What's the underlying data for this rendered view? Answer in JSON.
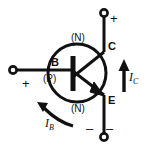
{
  "diagram": {
    "device_type": "NPN",
    "colors": {
      "background": "#ffffff",
      "stroke": "#111111",
      "text": "#111111"
    },
    "terminals": [
      {
        "id": "base",
        "label": "B",
        "side": "left",
        "node_marker": "open-circle"
      },
      {
        "id": "collector",
        "label": "C",
        "side": "top",
        "node_marker": "open-circle"
      },
      {
        "id": "emitter",
        "label": "E",
        "side": "bottom",
        "node_marker": "open-circle"
      }
    ],
    "region_labels": [
      {
        "id": "collector-region",
        "text": "(N)"
      },
      {
        "id": "base-region",
        "text": "(P)"
      },
      {
        "id": "emitter-region",
        "text": "(N)"
      }
    ],
    "polarity_signs": [
      {
        "id": "collector-positive",
        "text": "+"
      },
      {
        "id": "base-positive",
        "text": "+"
      },
      {
        "id": "emitter-negative-left",
        "text": "–"
      },
      {
        "id": "emitter-negative-right",
        "text": "–"
      }
    ],
    "currents": [
      {
        "id": "collector-current",
        "symbol": "I",
        "subscript": "C",
        "arrow": "up",
        "arrow_name": "collector-current-arrow"
      },
      {
        "id": "base-current",
        "symbol": "I",
        "subscript": "B",
        "arrow": "curved-left",
        "arrow_name": "base-current-arrow"
      }
    ],
    "symbol_parts": [
      {
        "id": "transistor-envelope",
        "shape": "circle"
      },
      {
        "id": "base-bar",
        "shape": "vertical-thick-line"
      },
      {
        "id": "collector-lead",
        "shape": "diagonal-line"
      },
      {
        "id": "emitter-lead",
        "shape": "diagonal-line-with-arrowhead"
      }
    ]
  }
}
